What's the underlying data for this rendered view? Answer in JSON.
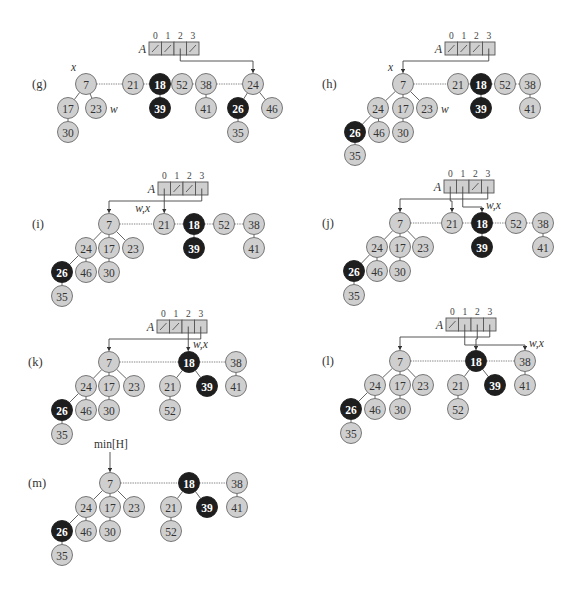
{
  "figure": {
    "array_name": "A",
    "array_indices": [
      "0",
      "1",
      "2",
      "3"
    ],
    "min_pointer_label": "min[H]",
    "colors": {
      "gray_node_fill": "#cfcfcf",
      "black_node_fill": "#1e1e1e",
      "edge": "#555555",
      "background": "#ffffff"
    }
  },
  "panels": [
    {
      "label": "(g)",
      "array_slots": [
        "nil",
        "nil",
        "ptr:24",
        "nil"
      ],
      "pointer_labels": [
        {
          "text": "x",
          "target": "7"
        },
        {
          "text": "w",
          "target": "23"
        }
      ],
      "roots": [
        "7",
        "21",
        "18",
        "52",
        "38",
        "24"
      ],
      "nodes": [
        {
          "key": "7",
          "marked": false,
          "children": [
            "17",
            "23"
          ]
        },
        {
          "key": "17",
          "marked": false,
          "children": [
            "30"
          ]
        },
        {
          "key": "30",
          "marked": false,
          "children": []
        },
        {
          "key": "23",
          "marked": false,
          "children": []
        },
        {
          "key": "21",
          "marked": false,
          "children": []
        },
        {
          "key": "18",
          "marked": true,
          "children": [
            "39"
          ]
        },
        {
          "key": "39",
          "marked": true,
          "children": []
        },
        {
          "key": "52",
          "marked": false,
          "children": []
        },
        {
          "key": "38",
          "marked": false,
          "children": [
            "41"
          ]
        },
        {
          "key": "41",
          "marked": false,
          "children": []
        },
        {
          "key": "24",
          "marked": false,
          "children": [
            "26",
            "46"
          ]
        },
        {
          "key": "26",
          "marked": true,
          "children": [
            "35"
          ]
        },
        {
          "key": "35",
          "marked": false,
          "children": []
        },
        {
          "key": "46",
          "marked": false,
          "children": []
        }
      ]
    },
    {
      "label": "(h)",
      "array_slots": [
        "nil",
        "nil",
        "nil",
        "ptr:7"
      ],
      "pointer_labels": [
        {
          "text": "x",
          "target": "7"
        },
        {
          "text": "w",
          "target": "23"
        }
      ],
      "roots": [
        "7",
        "21",
        "18",
        "52",
        "38"
      ],
      "nodes": [
        {
          "key": "7",
          "marked": false,
          "children": [
            "24",
            "17",
            "23"
          ]
        },
        {
          "key": "24",
          "marked": false,
          "children": [
            "26",
            "46"
          ]
        },
        {
          "key": "26",
          "marked": true,
          "children": [
            "35"
          ]
        },
        {
          "key": "35",
          "marked": false,
          "children": []
        },
        {
          "key": "46",
          "marked": false,
          "children": []
        },
        {
          "key": "17",
          "marked": false,
          "children": [
            "30"
          ]
        },
        {
          "key": "30",
          "marked": false,
          "children": []
        },
        {
          "key": "23",
          "marked": false,
          "children": []
        },
        {
          "key": "21",
          "marked": false,
          "children": []
        },
        {
          "key": "18",
          "marked": true,
          "children": [
            "39"
          ]
        },
        {
          "key": "39",
          "marked": true,
          "children": []
        },
        {
          "key": "52",
          "marked": false,
          "children": []
        },
        {
          "key": "38",
          "marked": false,
          "children": [
            "41"
          ]
        },
        {
          "key": "41",
          "marked": false,
          "children": []
        }
      ]
    },
    {
      "label": "(i)",
      "array_slots": [
        "ptr:21",
        "nil",
        "nil",
        "ptr:7"
      ],
      "pointer_labels": [
        {
          "text": "w,x",
          "target": "21"
        }
      ],
      "roots": [
        "7",
        "21",
        "18",
        "52",
        "38"
      ]
    },
    {
      "label": "(j)",
      "array_slots": [
        "ptr:21",
        "ptr:18",
        "nil",
        "ptr:7"
      ],
      "pointer_labels": [
        {
          "text": "w,x",
          "target": "18"
        }
      ],
      "roots": [
        "7",
        "21",
        "18",
        "52",
        "38"
      ]
    },
    {
      "label": "(k)",
      "array_slots": [
        "nil",
        "nil",
        "ptr:18",
        "ptr:7"
      ],
      "pointer_labels": [
        {
          "text": "w,x",
          "target": "18"
        }
      ],
      "roots": [
        "7",
        "18",
        "38"
      ],
      "nodes": [
        {
          "key": "18",
          "marked": true,
          "children": [
            "21",
            "39"
          ]
        },
        {
          "key": "21",
          "marked": false,
          "children": [
            "52"
          ]
        },
        {
          "key": "52",
          "marked": false,
          "children": []
        },
        {
          "key": "39",
          "marked": true,
          "children": []
        }
      ]
    },
    {
      "label": "(l)",
      "array_slots": [
        "nil",
        "ptr:38",
        "ptr:18",
        "ptr:7"
      ],
      "pointer_labels": [
        {
          "text": "w,x",
          "target": "38"
        }
      ],
      "roots": [
        "7",
        "18",
        "38"
      ]
    },
    {
      "label": "(m)",
      "array_slots": [],
      "pointer_labels": [
        {
          "text": "min[H]",
          "target": "7"
        }
      ],
      "roots": [
        "7",
        "18",
        "38"
      ]
    }
  ]
}
